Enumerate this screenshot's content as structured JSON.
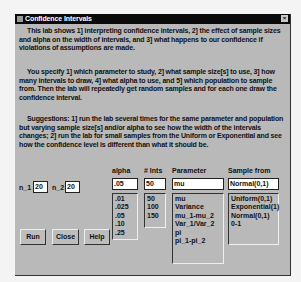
{
  "window": {
    "title": "Confidence Intervals",
    "close_label": "×"
  },
  "intro": {
    "p1": "This lab shows 1] interpreting confidence intervals, 2] the effect of sample sizes and alpha on the width of intervals, and 3] what happens to our confidence if violations of assumptions are made.",
    "p2": "You specify 1] which parameter to study, 2] what sample size[s] to use, 3] how many intervals to draw, 4] what alpha to use, and 5] which population to sample from. Then the lab will repeatedly get random samples and for each one draw the confidence interval.",
    "p3": "Suggestions: 1] run the lab several times for the same parameter and population but varying sample size[s] and/or alpha to see how the width of the intervals changes; 2] run the lab for small samples from the Uniform or Exponential and see how the confidence level is different than what it should be."
  },
  "inputs": {
    "n1_label": "n_1",
    "n1_value": "20",
    "n2_label": "n_2",
    "n2_value": "20"
  },
  "columns": {
    "alpha": {
      "header": "alpha",
      "value": ".05",
      "options": [
        ".01",
        ".025",
        ".05",
        ".10",
        ".25"
      ]
    },
    "ints": {
      "header": "# Ints",
      "value": "50",
      "options": [
        "50",
        "100",
        "150"
      ]
    },
    "parameter": {
      "header": "Parameter",
      "value": "mu",
      "options": [
        "mu",
        "Variance",
        "mu_1-mu_2",
        "Var_1/Var_2",
        "pi",
        "pi_1-pi_2"
      ]
    },
    "sample": {
      "header": "Sample from",
      "value": "Normal(0,1)",
      "options": [
        "Uniform(0,1)",
        "Exponential(1)",
        "Normal(0,1)",
        "0-1"
      ]
    }
  },
  "buttons": {
    "run": "Run",
    "close": "Close",
    "help": "Help"
  }
}
